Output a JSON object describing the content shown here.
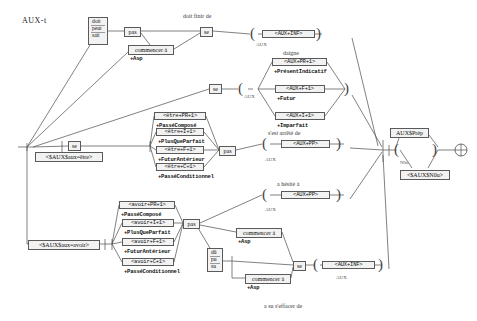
{
  "graph": {
    "title": "AUX-t",
    "kind": "finite-state-transducer",
    "width": 477,
    "height": 321
  },
  "annotations": [
    {
      "id": "a1",
      "text": "doit finir de",
      "x": 183,
      "y": 13
    },
    {
      "id": "a2",
      "text": "daigne",
      "x": 283,
      "y": 50
    },
    {
      "id": "a3",
      "text": "s'est arrêté de",
      "x": 268,
      "y": 130
    },
    {
      "id": "a4",
      "text": "a hésité à",
      "x": 277,
      "y": 181
    },
    {
      "id": "a5",
      "text": "a su s'effacer de",
      "x": 264,
      "y": 303
    }
  ],
  "sublabels": [
    {
      "id": "s1",
      "text": "AUX",
      "x": 256,
      "y": 42
    },
    {
      "id": "s2",
      "text": "AUX",
      "x": 244,
      "y": 94
    },
    {
      "id": "s3",
      "text": "AUX",
      "x": 265,
      "y": 157
    },
    {
      "id": "s4",
      "text": "AUX",
      "x": 265,
      "y": 207
    },
    {
      "id": "s5",
      "text": "AUX",
      "x": 336,
      "y": 275
    },
    {
      "id": "s6",
      "text": "N0u",
      "x": 400,
      "y": 160
    }
  ],
  "nodes": [
    {
      "id": "n-modaux-pres",
      "name": "stack-node-doit-peut-sait",
      "kind": "stack",
      "items": [
        "doit",
        "peut",
        "sait"
      ],
      "x": 88,
      "y": 17,
      "w": 20,
      "h": 28
    },
    {
      "id": "n-pas-1",
      "name": "node-pas-top",
      "kind": "plain",
      "text": "pas",
      "x": 124,
      "y": 27,
      "w": 17,
      "h": 9
    },
    {
      "id": "n-commencer-1",
      "name": "node-commencer-a-top",
      "kind": "plain",
      "text": "commencer à",
      "x": 128,
      "y": 45,
      "w": 46,
      "h": 9,
      "sub": "+Asp"
    },
    {
      "id": "n-se-1",
      "name": "node-se-top",
      "kind": "plain",
      "text": "se",
      "x": 200,
      "y": 27,
      "w": 13,
      "h": 9
    },
    {
      "id": "n-se-2",
      "name": "node-se-second",
      "kind": "plain",
      "text": "se",
      "x": 209,
      "y": 84,
      "w": 13,
      "h": 9
    },
    {
      "id": "n-aux-inf-1",
      "name": "tag-aux-inf-top",
      "kind": "tagbox",
      "text": "<AUX+INF>",
      "x": 262,
      "y": 30,
      "w": 53,
      "h": 9
    },
    {
      "id": "n-aux-pr",
      "name": "tag-aux-pr-1",
      "kind": "tagbox",
      "text": "<AUX+PR+1>",
      "x": 272,
      "y": 58,
      "w": 55,
      "h": 9,
      "sub": "+PrésentIndicatif"
    },
    {
      "id": "n-aux-f",
      "name": "tag-aux-f-1",
      "kind": "tagbox",
      "text": "<AUX+F+1>",
      "x": 275,
      "y": 85,
      "w": 50,
      "h": 9,
      "sub": "+Futur"
    },
    {
      "id": "n-aux-i",
      "name": "tag-aux-i-1",
      "kind": "tagbox",
      "text": "<AUX+I+1>",
      "x": 275,
      "y": 112,
      "w": 50,
      "h": 9,
      "sub": "+Imparfait"
    },
    {
      "id": "n-se-3",
      "name": "node-se-etre-branch",
      "kind": "plain",
      "text": "se",
      "x": 68,
      "y": 141,
      "w": 13,
      "h": 9
    },
    {
      "id": "n-etre-pr",
      "name": "tag-etre-pr-1",
      "kind": "tagbox",
      "text": "<être+PR+1>",
      "x": 154,
      "y": 112,
      "w": 52,
      "h": 9,
      "sub": "+PasséComposé"
    },
    {
      "id": "n-etre-i",
      "name": "tag-etre-i-1",
      "kind": "tagbox",
      "text": "<être+I+1>",
      "x": 156,
      "y": 128,
      "w": 48,
      "h": 9,
      "sub": "+PlusQueParfait"
    },
    {
      "id": "n-etre-f",
      "name": "tag-etre-f-1",
      "kind": "tagbox",
      "text": "<être+F+1>",
      "x": 156,
      "y": 146,
      "w": 48,
      "h": 9,
      "sub": "+FuturAntérieur"
    },
    {
      "id": "n-etre-c",
      "name": "tag-etre-c-1",
      "kind": "tagbox",
      "text": "<être+C+1>",
      "x": 156,
      "y": 163,
      "w": 48,
      "h": 9,
      "sub": "+PasséConditionnel"
    },
    {
      "id": "n-pas-2",
      "name": "node-pas-etre",
      "kind": "plain",
      "text": "pas",
      "x": 219,
      "y": 146,
      "w": 17,
      "h": 9
    },
    {
      "id": "n-aux-pp-1",
      "name": "tag-aux-pp-etre",
      "kind": "tagbox",
      "text": "<AUX+PP>",
      "x": 281,
      "y": 140,
      "w": 49,
      "h": 9
    },
    {
      "id": "n-aux-pp-2",
      "name": "tag-aux-pp-avoir",
      "kind": "tagbox",
      "text": "<AUX+PP>",
      "x": 281,
      "y": 191,
      "w": 49,
      "h": 9
    },
    {
      "id": "n-avoir-pr",
      "name": "tag-avoir-pr-1",
      "kind": "tagbox",
      "text": "<avoir+PR+1>",
      "x": 119,
      "y": 201,
      "w": 56,
      "h": 9,
      "sub": "+PasséComposé"
    },
    {
      "id": "n-avoir-i",
      "name": "tag-avoir-i-1",
      "kind": "tagbox",
      "text": "<avoir+I+1>",
      "x": 122,
      "y": 219,
      "w": 52,
      "h": 9,
      "sub": "+PlusQueParfait"
    },
    {
      "id": "n-avoir-f",
      "name": "tag-avoir-f-1",
      "kind": "tagbox",
      "text": "<avoir+F+1>",
      "x": 122,
      "y": 238,
      "w": 52,
      "h": 9,
      "sub": "+FuturAntérieur"
    },
    {
      "id": "n-avoir-c",
      "name": "tag-avoir-c-1",
      "kind": "tagbox",
      "text": "<avoir+C+1>",
      "x": 122,
      "y": 258,
      "w": 52,
      "h": 9,
      "sub": "+PasséConditionnel"
    },
    {
      "id": "n-pas-3",
      "name": "node-pas-avoir",
      "kind": "plain",
      "text": "pas",
      "x": 183,
      "y": 219,
      "w": 17,
      "h": 9
    },
    {
      "id": "n-commencer-2",
      "name": "node-commencer-a-mid",
      "kind": "plain",
      "text": "commencer à",
      "x": 236,
      "y": 228,
      "w": 46,
      "h": 9,
      "sub": "+Asp"
    },
    {
      "id": "n-du-pu-su",
      "name": "stack-node-du-pu-su",
      "kind": "stack",
      "items": [
        "dû",
        "pu",
        "su"
      ],
      "x": 207,
      "y": 248,
      "w": 16,
      "h": 24
    },
    {
      "id": "n-commencer-3",
      "name": "node-commencer-a-bottom",
      "kind": "plain",
      "text": "commencer à",
      "x": 245,
      "y": 274,
      "w": 46,
      "h": 9,
      "sub": "+Asp"
    },
    {
      "id": "n-se-4",
      "name": "node-se-bottom",
      "kind": "plain",
      "text": "se",
      "x": 293,
      "y": 261,
      "w": 13,
      "h": 9
    },
    {
      "id": "n-aux-inf-2",
      "name": "tag-aux-inf-bottom",
      "kind": "tagbox",
      "text": "<AUX+INF>",
      "x": 322,
      "y": 261,
      "w": 53,
      "h": 9
    },
    {
      "id": "n-prep",
      "name": "node-aux-prep",
      "kind": "plain",
      "text": "AUX$Prép",
      "x": 390,
      "y": 128,
      "w": 39,
      "h": 9
    },
    {
      "id": "n-n0u",
      "name": "node-aux-n0u",
      "kind": "plain",
      "text": "<$AUX$N0u>",
      "x": 400,
      "y": 170,
      "w": 50,
      "h": 9
    },
    {
      "id": "n-aux-etre",
      "name": "node-aux-aux-etre",
      "kind": "plain",
      "text": "<$AUX$aux=être>",
      "x": 35,
      "y": 152,
      "w": 68,
      "h": 9
    },
    {
      "id": "n-aux-avoir",
      "name": "node-aux-aux-avoir",
      "kind": "plain",
      "text": "<$AUX$aux=avoir>",
      "x": 28,
      "y": 240,
      "w": 72,
      "h": 9
    }
  ],
  "legend": {
    "open_paren": "(",
    "close_paren": ")"
  }
}
